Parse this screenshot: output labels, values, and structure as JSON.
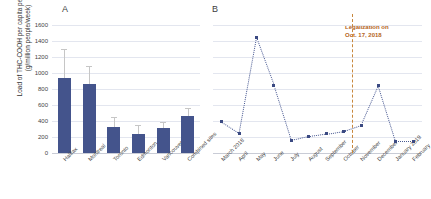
{
  "figure": {
    "panel_a_letter": "A",
    "panel_b_letter": "B",
    "y_axis_label": "Load of THC-COOH per capita per week (g/million people/week)"
  },
  "annotation": {
    "line1": "Legalization on",
    "line2": "Oct. 17, 2018",
    "color": "#b5651d"
  },
  "colors": {
    "bar": "#44548c",
    "marker": "#3b4a82",
    "error": "#c6c6c6",
    "grid": "#e3e6ef",
    "legalization": "#c8873c"
  },
  "chart_data": [
    {
      "type": "bar",
      "panel": "A",
      "title": "",
      "xlabel": "",
      "ylabel": "Load of THC-COOH per capita per week (g/million people/week)",
      "ylim": [
        0,
        1600
      ],
      "yticks": [
        0,
        200,
        400,
        600,
        800,
        1000,
        1200,
        1400,
        1600
      ],
      "grid": true,
      "categories": [
        "Halifax",
        "Montreal",
        "Toronto",
        "Edmonton",
        "Vancouver",
        "Combined sites"
      ],
      "values": [
        935,
        860,
        330,
        240,
        310,
        460
      ],
      "error_upper": [
        1300,
        1090,
        445,
        350,
        390,
        560
      ],
      "error_lower": [
        935,
        860,
        330,
        240,
        310,
        460
      ]
    },
    {
      "type": "line",
      "panel": "B",
      "title": "",
      "xlabel": "",
      "ylabel": "",
      "ylim": [
        0,
        1600
      ],
      "yticks": [
        0,
        200,
        400,
        600,
        800,
        1000,
        1200,
        1400,
        1600
      ],
      "grid": true,
      "legend": "none",
      "line_style": "dotted",
      "marker": "square",
      "categories": [
        "March 2018",
        "April",
        "May",
        "June",
        "July",
        "August",
        "September",
        "October",
        "November",
        "December",
        "January 2019",
        "February"
      ],
      "values": [
        390,
        250,
        1440,
        850,
        160,
        210,
        240,
        275,
        350,
        850,
        150,
        150
      ],
      "annotations": [
        {
          "text": "Legalization on Oct. 17, 2018",
          "between_categories": [
            "October",
            "November"
          ],
          "style": "vertical dashed line"
        }
      ]
    }
  ]
}
